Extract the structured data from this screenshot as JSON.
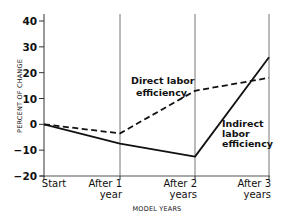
{
  "chart_data": {
    "type": "line",
    "title": "",
    "xlabel": "MODEL YEARS",
    "ylabel": "PERCENT OF CHANGE",
    "categories": [
      "Start",
      "After 1 year",
      "After 2 years",
      "After 3 years"
    ],
    "category_lines": [
      [
        "Start"
      ],
      [
        "After 1",
        "year"
      ],
      [
        "After 2",
        "years"
      ],
      [
        "After 3",
        "years"
      ]
    ],
    "ylim": [
      -20,
      40
    ],
    "yticks": [
      40,
      30,
      20,
      10,
      0,
      -10,
      -20
    ],
    "grid": {
      "vertical": true,
      "horizontal": false
    },
    "legend": "inline annotations",
    "series": [
      {
        "name": "Direct labor efficiency",
        "label_lines": [
          "Direct labor",
          "efficiency"
        ],
        "style": "dashed",
        "values": [
          0,
          -3.5,
          13,
          18
        ]
      },
      {
        "name": "Indirect labor efficiency",
        "label_lines": [
          "Indirect",
          "labor",
          "efficiency"
        ],
        "style": "solid",
        "values": [
          0,
          -7.5,
          -12.5,
          26
        ]
      }
    ]
  }
}
